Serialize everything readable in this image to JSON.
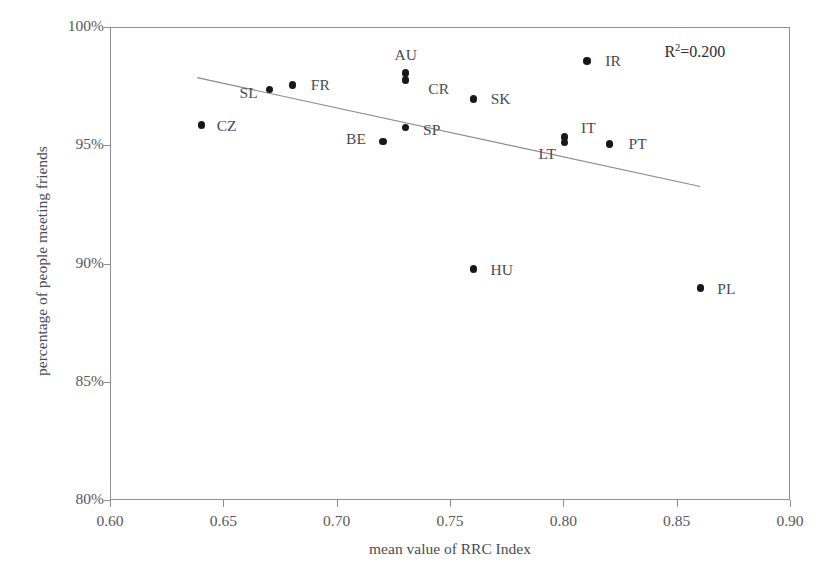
{
  "chart_data": {
    "type": "scatter",
    "title": "",
    "title_sliver": "",
    "xlabel": "mean value of RRC Index",
    "ylabel": "percentage of people meeting friends",
    "xlim": [
      0.6,
      0.9
    ],
    "ylim": [
      80,
      100
    ],
    "xticks": [
      "0.60",
      "0.65",
      "0.70",
      "0.75",
      "0.80",
      "0.85",
      "0.90"
    ],
    "xtick_values": [
      0.6,
      0.65,
      0.7,
      0.75,
      0.8,
      0.85,
      0.9
    ],
    "yticks": [
      "80%",
      "85%",
      "90%",
      "95%",
      "100%"
    ],
    "ytick_values": [
      80,
      85,
      90,
      95,
      100
    ],
    "grid": false,
    "legend": "none",
    "annotations": [
      {
        "text": "R2=0.200",
        "label": "R",
        "sup": "2",
        "rest": "=0.200",
        "x": 0.864,
        "y": 99.0
      }
    ],
    "r_squared": 0.2,
    "trendline": {
      "type": "linear",
      "x_start": 0.638,
      "y_start": 97.9,
      "x_end": 0.86,
      "y_end": 93.3
    },
    "points": [
      {
        "label": "CZ",
        "x": 0.64,
        "y": 95.9,
        "label_dx": 25,
        "label_dy": 1
      },
      {
        "label": "SL",
        "x": 0.67,
        "y": 97.4,
        "label_dx": -21,
        "label_dy": 4
      },
      {
        "label": "FR",
        "x": 0.68,
        "y": 97.6,
        "label_dx": 28,
        "label_dy": 0
      },
      {
        "label": "BE",
        "x": 0.72,
        "y": 95.2,
        "label_dx": -27,
        "label_dy": -3
      },
      {
        "label": "AU",
        "x": 0.73,
        "y": 98.1,
        "label_dx": 0,
        "label_dy": -18
      },
      {
        "label": "CR",
        "x": 0.73,
        "y": 97.8,
        "label_dx": 33,
        "label_dy": 9
      },
      {
        "label": "SP",
        "x": 0.73,
        "y": 95.8,
        "label_dx": 26,
        "label_dy": 3
      },
      {
        "label": "SK",
        "x": 0.76,
        "y": 97.0,
        "label_dx": 27,
        "label_dy": 0
      },
      {
        "label": "HU",
        "x": 0.76,
        "y": 89.8,
        "label_dx": 28,
        "label_dy": 1
      },
      {
        "label": "IT",
        "x": 0.8,
        "y": 95.4,
        "label_dx": 24,
        "label_dy": -9
      },
      {
        "label": "LT",
        "x": 0.8,
        "y": 95.15,
        "label_dx": -17,
        "label_dy": 11
      },
      {
        "label": "IR",
        "x": 0.81,
        "y": 98.6,
        "label_dx": 26,
        "label_dy": 0
      },
      {
        "label": "PT",
        "x": 0.82,
        "y": 95.1,
        "label_dx": 28,
        "label_dy": 0
      },
      {
        "label": "PL",
        "x": 0.86,
        "y": 89.0,
        "label_dx": 26,
        "label_dy": 1
      }
    ]
  }
}
